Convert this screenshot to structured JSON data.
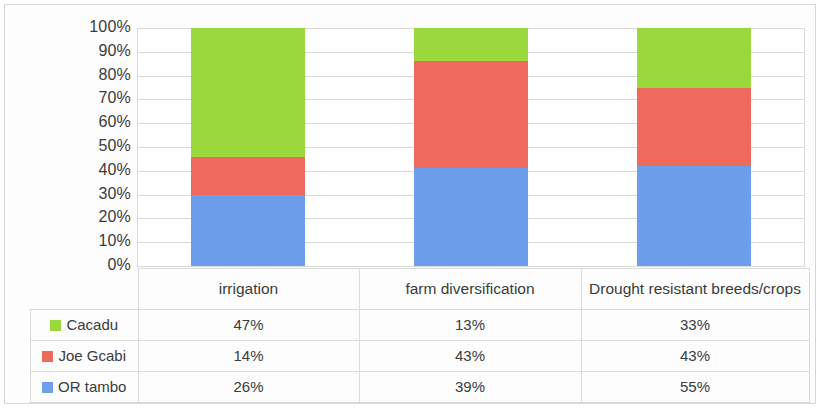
{
  "chart_data": {
    "type": "bar",
    "subtype": "100% stacked column",
    "title": "",
    "xlabel": "",
    "ylabel": "",
    "ylim": [
      0,
      100
    ],
    "grid": true,
    "legend_position": "bottom-left (data table row headers)",
    "categories": [
      "irrigation",
      "farm diversification",
      "Drought resistant breeds/crops"
    ],
    "series": [
      {
        "name": "Cacadu",
        "color": "#9ad83c",
        "values": [
          47,
          13,
          33
        ],
        "labels": [
          "47%",
          "13%",
          "33%"
        ]
      },
      {
        "name": "Joe Gcabi",
        "color": "#ee6a5c",
        "values": [
          14,
          43,
          43
        ],
        "labels": [
          "14%",
          "43%",
          "43%"
        ]
      },
      {
        "name": "OR tambo",
        "color": "#6d9eeb",
        "values": [
          26,
          39,
          55
        ],
        "labels": [
          "26%",
          "39%",
          "55%"
        ]
      }
    ],
    "stack_order_bottom_to_top": [
      "OR tambo",
      "Joe Gcabi",
      "Cacadu"
    ],
    "normalized_percentages": [
      {
        "category": "irrigation",
        "OR tambo": 29.9,
        "Joe Gcabi": 16.1,
        "Cacadu": 54.0
      },
      {
        "category": "farm diversification",
        "OR tambo": 40.2,
        "Joe Gcabi": 44.3,
        "Cacadu": 13.4
      },
      {
        "category": "Drought resistant breeds/crops",
        "OR tambo": 41.9,
        "Joe Gcabi": 32.8,
        "Cacadu": 25.2
      }
    ],
    "ytick_labels": [
      "100%",
      "90%",
      "80%",
      "70%",
      "60%",
      "50%",
      "40%",
      "30%",
      "20%",
      "10%",
      "0%"
    ],
    "ytick_values": [
      100,
      90,
      80,
      70,
      60,
      50,
      40,
      30,
      20,
      10,
      0
    ]
  },
  "table": {
    "legend_header": "",
    "column_headers": [
      "irrigation",
      "farm diversification",
      "Drought resistant breeds/crops"
    ],
    "rows": [
      {
        "label": "Cacadu",
        "swatch_color": "#9ad83c",
        "values": [
          "47%",
          "13%",
          "33%"
        ]
      },
      {
        "label": "Joe Gcabi",
        "swatch_color": "#ee6a5c",
        "values": [
          "14%",
          "43%",
          "43%"
        ]
      },
      {
        "label": "OR tambo",
        "swatch_color": "#6d9eeb",
        "values": [
          "26%",
          "39%",
          "55%"
        ]
      }
    ]
  },
  "colors": {
    "cacadu": "#9ad83c",
    "joe_gcabi": "#ee6a5c",
    "or_tambo": "#6d9eeb",
    "gridline": "#d9d9d9",
    "border": "#dcdcdc",
    "text": "#3b3b3b"
  }
}
